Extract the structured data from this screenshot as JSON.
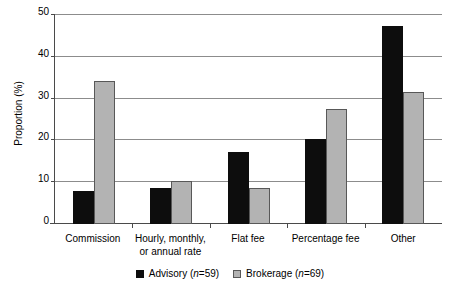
{
  "chart_data": {
    "type": "bar",
    "title": "",
    "xlabel": "",
    "ylabel": "Proportion (%)",
    "ylim": [
      0,
      50
    ],
    "yticks": [
      0,
      10,
      20,
      30,
      40,
      50
    ],
    "ytick_labels": [
      "0",
      "10",
      "20",
      "30",
      "40",
      "50"
    ],
    "grid": true,
    "legend_position": "bottom",
    "categories": [
      "Commission",
      "Hourly, monthly,\nor annual rate",
      "Flat fee",
      "Percentage fee",
      "Other"
    ],
    "category_lines": [
      [
        "Commission"
      ],
      [
        "Hourly, monthly,",
        "or annual rate"
      ],
      [
        "Flat fee"
      ],
      [
        "Percentage fee"
      ],
      [
        "Other"
      ]
    ],
    "series": [
      {
        "name": "Advisory",
        "n": 59,
        "legend_label": "Advisory (n=59)",
        "color": "#0d0d0d",
        "values": [
          8.0,
          8.5,
          17.2,
          20.3,
          47.3
        ]
      },
      {
        "name": "Brokerage",
        "n": 69,
        "legend_label": "Brokerage (n=69)",
        "color": "#b3b3b3",
        "values": [
          34.2,
          10.3,
          8.5,
          27.5,
          31.6
        ]
      }
    ]
  },
  "colors": {
    "advisory": "#0d0d0d",
    "brokerage": "#b3b3b3",
    "axis": "#4a4a4a",
    "grid": "#8c8c8c",
    "background": "#ffffff"
  },
  "legend": {
    "items": [
      {
        "label_prefix": "Advisory (",
        "n_symbol": "n",
        "n_value": "=59)"
      },
      {
        "label_prefix": "Brokerage (",
        "n_symbol": "n",
        "n_value": "=69)"
      }
    ]
  }
}
